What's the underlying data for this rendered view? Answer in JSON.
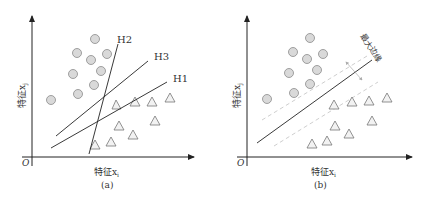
{
  "panels": [
    {
      "id": "a",
      "caption": "(a)",
      "xlabel": "特征x",
      "xlabel_sub": "i",
      "ylabel": "特征x",
      "ylabel_sub": "j",
      "origin": "O",
      "lines": [
        {
          "label": "H1"
        },
        {
          "label": "H2"
        },
        {
          "label": "H3"
        }
      ]
    },
    {
      "id": "b",
      "caption": "(b)",
      "xlabel": "特征x",
      "xlabel_sub": "i",
      "ylabel": "特征x",
      "ylabel_sub": "j",
      "origin": "O",
      "margin_label": "最大边缘"
    }
  ],
  "colors": {
    "circle_fill": "#d9d9d9",
    "circle_stroke": "#8a8a8a",
    "triangle_stroke": "#777777",
    "axis": "#222222",
    "margin_dashed": "#c8c8c8"
  }
}
